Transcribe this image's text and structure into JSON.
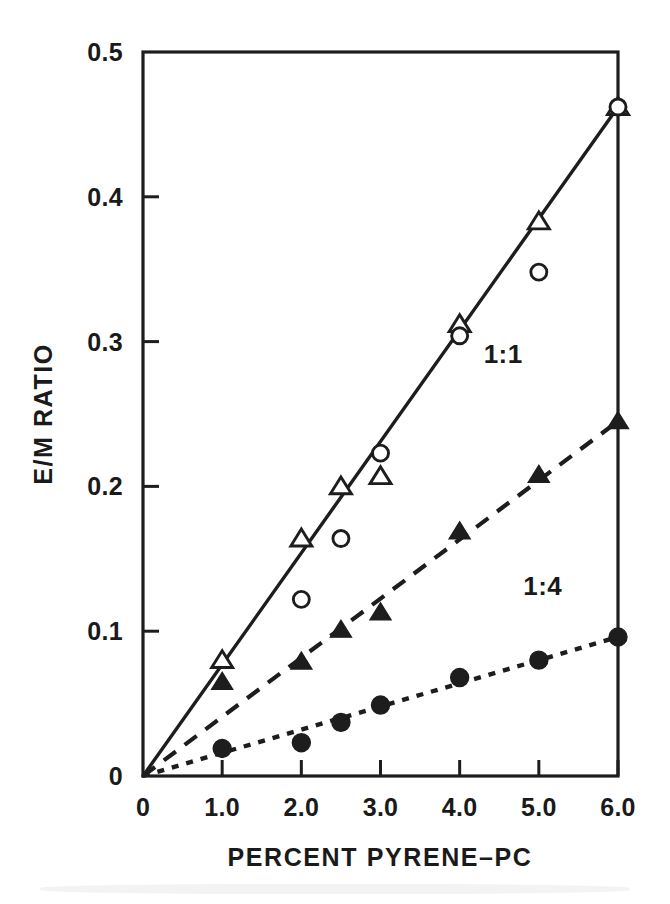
{
  "chart_data": {
    "type": "scatter",
    "title": "",
    "subtitle": "",
    "xlabel": "PERCENT PYRENE–PC",
    "ylabel": "E/M RATIO",
    "xlim": [
      0,
      6
    ],
    "ylim": [
      0,
      0.5
    ],
    "xticks": [
      0,
      1,
      2,
      3,
      4,
      5,
      6
    ],
    "yticks": [
      0,
      0.1,
      0.2,
      0.3,
      0.4,
      0.5
    ],
    "xtick_labels": [
      "0",
      "1.0",
      "2.0",
      "3.0",
      "4.0",
      "5.0",
      "6.0"
    ],
    "ytick_labels": [
      "0",
      "0.1",
      "0.2",
      "0.3",
      "0.4",
      "0.5"
    ],
    "grid": false,
    "legend_position": "inline-annotation",
    "series": [
      {
        "name": "open-triangle-series",
        "marker": "open-triangle",
        "line_style": "solid",
        "annotation": "",
        "x": [
          1.0,
          2.0,
          2.5,
          3.0,
          4.0,
          5.0,
          6.0
        ],
        "values": [
          0.08,
          0.164,
          0.2,
          0.207,
          0.312,
          0.383,
          0.462
        ]
      },
      {
        "name": "open-circle-series",
        "marker": "open-circle",
        "line_style": "none",
        "annotation": "",
        "x": [
          2.0,
          2.5,
          3.0,
          4.0,
          5.0,
          6.0
        ],
        "values": [
          0.122,
          0.164,
          0.223,
          0.304,
          0.348,
          0.462
        ]
      },
      {
        "name": "filled-triangle-series",
        "marker": "filled-triangle",
        "line_style": "dashed",
        "annotation": "1:1",
        "x": [
          1.0,
          2.0,
          2.5,
          3.0,
          4.0,
          5.0,
          6.0
        ],
        "values": [
          0.065,
          0.079,
          0.101,
          0.113,
          0.169,
          0.208,
          0.245
        ]
      },
      {
        "name": "filled-circle-series",
        "marker": "filled-circle",
        "line_style": "dotted",
        "annotation": "1:4",
        "x": [
          1.0,
          2.0,
          2.5,
          3.0,
          4.0,
          5.0,
          6.0
        ],
        "values": [
          0.019,
          0.023,
          0.037,
          0.049,
          0.068,
          0.08,
          0.096
        ]
      }
    ],
    "fit_lines": [
      {
        "name": "solid-fit",
        "style": "solid",
        "x0": 0,
        "y0": 0,
        "x1": 6.0,
        "y1": 0.462
      },
      {
        "name": "dashed-fit",
        "style": "dashed",
        "x0": 0,
        "y0": 0,
        "x1": 6.0,
        "y1": 0.245
      },
      {
        "name": "dotted-fit",
        "style": "dotted",
        "x0": 0,
        "y0": 0,
        "x1": 6.0,
        "y1": 0.096
      }
    ],
    "annotations": [
      {
        "text": "1:1",
        "x": 4.55,
        "y": 0.285
      },
      {
        "text": "1:4",
        "x": 5.05,
        "y": 0.125
      }
    ],
    "colors": {
      "ink": "#1d1d1d",
      "background": "#ffffff"
    }
  },
  "axis": {
    "x_title": "PERCENT PYRENE–PC",
    "y_title": "E/M RATIO"
  }
}
